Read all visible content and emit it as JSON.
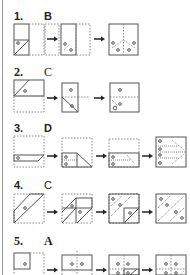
{
  "problems": [
    {
      "number": "1.",
      "answer": "B",
      "panels": 3
    },
    {
      "number": "2.",
      "answer": "C",
      "panels": 3
    },
    {
      "number": "3.",
      "answer": "D",
      "panels": 4
    },
    {
      "number": "4.",
      "answer": "C",
      "panels": 4
    },
    {
      "number": "5.",
      "answer": "A",
      "panels": 4
    }
  ],
  "arrow_icon": "right-arrow",
  "colors": {
    "solid": "#555555",
    "dashed": "#888888",
    "text": "#222222"
  }
}
